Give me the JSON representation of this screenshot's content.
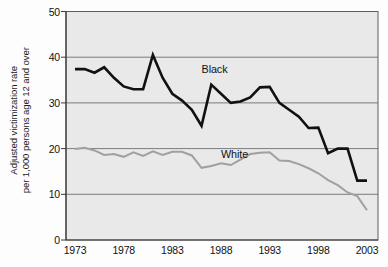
{
  "chart_data": {
    "type": "line",
    "title": "",
    "xlabel": "",
    "ylabel": "Adjusted victimization rate per 1,000 persons age 12 and over",
    "ylabel_line1": "Adjusted victimization rate",
    "ylabel_line2": "per 1,000 persons age 12 and over",
    "xlim": [
      1973,
      2003
    ],
    "ylim": [
      0,
      50
    ],
    "yticks": [
      0,
      10,
      20,
      30,
      40,
      50
    ],
    "ytick_labels": [
      "0",
      "10",
      "20",
      "30",
      "40",
      "50"
    ],
    "xticks": [
      1973,
      1978,
      1983,
      1988,
      1993,
      1998,
      2003
    ],
    "xtick_labels": [
      "1973",
      "1978",
      "1983",
      "1988",
      "1993",
      "1998",
      "2003"
    ],
    "grid": "horizontal",
    "legend_position": "inline-annotation",
    "plot_background": "#e9e9e9",
    "gridline_color": "#7b7b7b",
    "x": [
      1973,
      1974,
      1975,
      1976,
      1977,
      1978,
      1979,
      1980,
      1981,
      1982,
      1983,
      1984,
      1985,
      1986,
      1987,
      1988,
      1989,
      1990,
      1991,
      1992,
      1993,
      1994,
      1995,
      1996,
      1997,
      1998,
      1999,
      2000,
      2001,
      2002,
      2003
    ],
    "series": [
      {
        "name": "Black",
        "color": "#111111",
        "line_width": 2.6,
        "label_x": 1986,
        "label_y": 37.0,
        "values": [
          37.4,
          37.4,
          36.6,
          37.8,
          35.5,
          33.6,
          33.0,
          33.0,
          40.5,
          35.5,
          32.0,
          30.5,
          28.5,
          25.0,
          34.0,
          32.0,
          30.0,
          30.3,
          31.2,
          33.4,
          33.5,
          30.0,
          28.5,
          27.0,
          24.5,
          24.6,
          19.0,
          20.0,
          20.0,
          13.0,
          13.0
        ]
      },
      {
        "name": "White",
        "color": "#a0a0a0",
        "line_width": 2.0,
        "label_x": 1988,
        "label_y": 18.4,
        "values": [
          19.9,
          20.2,
          19.6,
          18.6,
          18.8,
          18.2,
          19.2,
          18.4,
          19.4,
          18.6,
          19.3,
          19.3,
          18.5,
          15.8,
          16.2,
          16.8,
          16.4,
          17.6,
          18.8,
          19.1,
          19.2,
          17.4,
          17.3,
          16.6,
          15.7,
          14.6,
          13.1,
          12.0,
          10.4,
          9.6,
          6.5
        ]
      }
    ]
  }
}
